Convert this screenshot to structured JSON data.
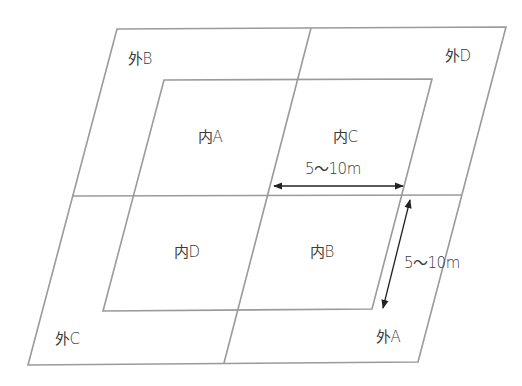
{
  "diagram": {
    "colors": {
      "frame_line": "#9a9a9a",
      "arrow_line": "#222222",
      "text": "#3a3a3a",
      "background": "#ffffff"
    },
    "outer_regions": {
      "top_left": "外B",
      "top_right": "外D",
      "bottom_left": "外C",
      "bottom_right": "外A"
    },
    "inner_regions": {
      "top_left": "内A",
      "top_right": "内C",
      "bottom_left": "内D",
      "bottom_right": "内B"
    },
    "dimensions": {
      "horizontal": "5〜10m",
      "diagonal": "5〜10m"
    }
  }
}
